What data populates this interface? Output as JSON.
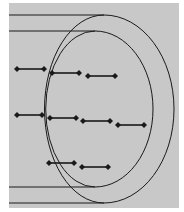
{
  "diagram": {
    "background": "#c8c8c8",
    "page_color": "#ffffff",
    "stroke_color": "#1a1a1a",
    "panel": {
      "x": 9,
      "y": 3,
      "w": 170,
      "h": 205
    },
    "tracks": {
      "outer": {
        "top_y": 15,
        "bottom_y": 203,
        "left_x": 9,
        "cx": 104,
        "rx": 70,
        "ry": 94,
        "cy": 109
      },
      "inner": {
        "top_y": 31,
        "bottom_y": 187,
        "left_x": 9,
        "cx": 95,
        "rx": 58,
        "ry": 78,
        "cy": 109
      }
    },
    "arrows": [
      {
        "row": 1,
        "x1": 17,
        "y1": 69,
        "x2": 44,
        "y2": 69
      },
      {
        "row": 1,
        "x1": 52,
        "y1": 73,
        "x2": 79,
        "y2": 73
      },
      {
        "row": 1,
        "x1": 88,
        "y1": 76,
        "x2": 115,
        "y2": 76
      },
      {
        "row": 2,
        "x1": 17,
        "y1": 115,
        "x2": 42,
        "y2": 115
      },
      {
        "row": 2,
        "x1": 50,
        "y1": 118,
        "x2": 76,
        "y2": 118
      },
      {
        "row": 2,
        "x1": 83,
        "y1": 121,
        "x2": 110,
        "y2": 121
      },
      {
        "row": 2,
        "x1": 118,
        "y1": 125,
        "x2": 144,
        "y2": 125
      },
      {
        "row": 3,
        "x1": 49,
        "y1": 163,
        "x2": 74,
        "y2": 163
      },
      {
        "row": 3,
        "x1": 82,
        "y1": 167,
        "x2": 108,
        "y2": 167
      }
    ]
  }
}
